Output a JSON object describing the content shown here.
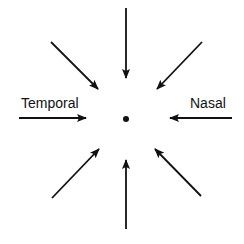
{
  "diagram": {
    "labels": {
      "left": "Temporal",
      "right": "Nasal"
    },
    "center": {
      "x": 126,
      "y": 119,
      "r": 3
    },
    "color": "#111111",
    "arrows": [
      {
        "name": "arrow-from-top",
        "x1": 126,
        "y1": 8,
        "x2": 126,
        "y2": 78
      },
      {
        "name": "arrow-from-top-left",
        "x1": 51,
        "y1": 42,
        "x2": 98,
        "y2": 89
      },
      {
        "name": "arrow-from-top-right",
        "x1": 202,
        "y1": 42,
        "x2": 157,
        "y2": 89
      },
      {
        "name": "arrow-from-left",
        "x1": 19,
        "y1": 118,
        "x2": 86,
        "y2": 118
      },
      {
        "name": "arrow-from-right",
        "x1": 232,
        "y1": 118,
        "x2": 170,
        "y2": 118
      },
      {
        "name": "arrow-from-bottom-left",
        "x1": 52,
        "y1": 198,
        "x2": 99,
        "y2": 149
      },
      {
        "name": "arrow-from-bottom-right",
        "x1": 201,
        "y1": 196,
        "x2": 155,
        "y2": 149
      },
      {
        "name": "arrow-from-bottom",
        "x1": 126,
        "y1": 229,
        "x2": 126,
        "y2": 160
      }
    ]
  }
}
